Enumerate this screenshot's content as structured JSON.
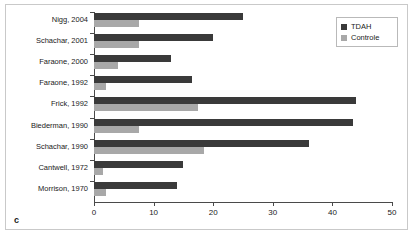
{
  "panel": {
    "label": "c"
  },
  "legend": {
    "position": "top-right",
    "entries": [
      {
        "name": "TDAH",
        "color": "#3a3a3a",
        "swatch": "legend-swatch-tdah"
      },
      {
        "name": "Controle",
        "color": "#a8a8a8",
        "swatch": "legend-swatch-controle"
      }
    ]
  },
  "axis": {
    "x_ticks": [
      "0",
      "10",
      "20",
      "30",
      "40",
      "50"
    ],
    "x_min": 0,
    "x_max": 50
  },
  "chart_data": {
    "type": "bar",
    "orientation": "horizontal",
    "title": "",
    "subtitle": "",
    "xlabel": "",
    "ylabel": "",
    "xlim": [
      0,
      50
    ],
    "xticks": [
      0,
      10,
      20,
      30,
      40,
      50
    ],
    "grid": false,
    "legend_position": "top-right",
    "categories": [
      "Nigg, 2004",
      "Schachar, 2001",
      "Faraone, 2000",
      "Faraone, 1992",
      "Frick, 1992",
      "Biederman, 1990",
      "Schachar, 1990",
      "Cantwell, 1972",
      "Morrison, 1970"
    ],
    "series": [
      {
        "name": "TDAH",
        "color": "#3a3a3a",
        "values": [
          25,
          20,
          13,
          16.5,
          44,
          43.5,
          36,
          15,
          14
        ]
      },
      {
        "name": "Controle",
        "color": "#a8a8a8",
        "values": [
          7.5,
          7.5,
          4,
          2,
          17.5,
          7.5,
          18.5,
          1.5,
          2
        ]
      }
    ],
    "annotations": [
      "c"
    ]
  }
}
